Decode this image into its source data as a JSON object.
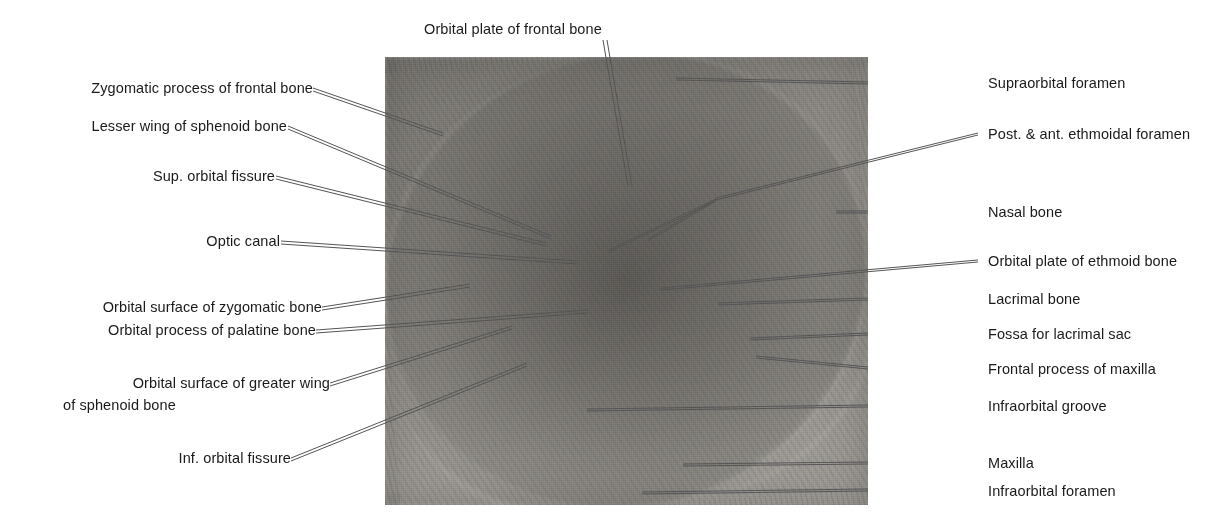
{
  "figure": {
    "image_description": "Grayscale photograph of the left bony orbit (eye socket) viewed from the front, with thin leader lines radiating to anatomical labels."
  },
  "photo": {
    "x": 385,
    "y": 57,
    "width": 483,
    "height": 448,
    "alt": "Photograph of the bony orbit"
  },
  "labels": {
    "top": [
      {
        "id": "orbital-plate-frontal-bone",
        "text": "Orbital plate of frontal bone"
      }
    ],
    "left": [
      {
        "id": "zygomatic-process-frontal-bone",
        "text": "Zygomatic process of frontal bone"
      },
      {
        "id": "lesser-wing-sphenoid-bone",
        "text": "Lesser wing of sphenoid bone"
      },
      {
        "id": "sup-orbital-fissure",
        "text": "Sup. orbital fissure"
      },
      {
        "id": "optic-canal",
        "text": "Optic canal"
      },
      {
        "id": "orbital-surface-zygomatic-bone",
        "text": "Orbital surface of zygomatic bone"
      },
      {
        "id": "orbital-process-palatine-bone",
        "text": "Orbital process of palatine bone"
      },
      {
        "id": "orbital-surface-greater-wing-sphenoid-line1",
        "text": "Orbital surface of greater wing"
      },
      {
        "id": "orbital-surface-greater-wing-sphenoid-line2",
        "text": "of sphenoid bone"
      },
      {
        "id": "inf-orbital-fissure",
        "text": "Inf. orbital fissure"
      }
    ],
    "right": [
      {
        "id": "supraorbital-foramen",
        "text": "Supraorbital foramen"
      },
      {
        "id": "post-ant-ethmoidal-foramen",
        "text": "Post. & ant. ethmoidal foramen"
      },
      {
        "id": "nasal-bone",
        "text": "Nasal bone"
      },
      {
        "id": "orbital-plate-ethmoid-bone",
        "text": "Orbital plate of ethmoid bone"
      },
      {
        "id": "lacrimal-bone",
        "text": "Lacrimal bone"
      },
      {
        "id": "fossa-for-lacrimal-sac",
        "text": "Fossa for lacrimal sac"
      },
      {
        "id": "frontal-process-maxilla",
        "text": "Frontal process of maxilla"
      },
      {
        "id": "infraorbital-groove",
        "text": "Infraorbital groove"
      },
      {
        "id": "maxilla",
        "text": "Maxilla"
      },
      {
        "id": "infraorbital-foramen",
        "text": "Infraorbital foramen"
      }
    ]
  },
  "colors": {
    "background": "#ffffff",
    "text": "#1a1a1a",
    "leader_line": "#555555",
    "photo_mid_tone": "#b3b0ab"
  }
}
